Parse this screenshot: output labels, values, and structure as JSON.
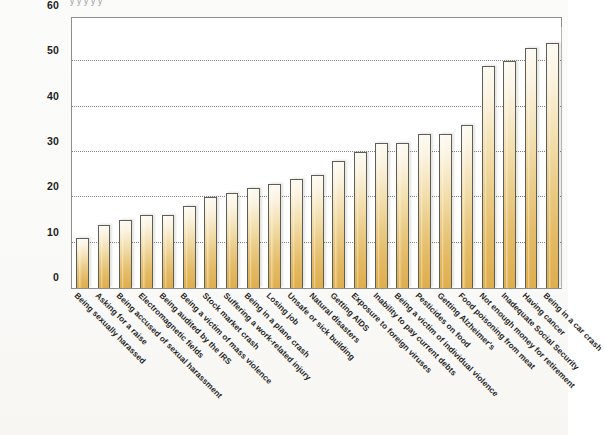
{
  "figure": {
    "title_strip": "y y y                     y                 y",
    "background_color": "#fafaf8"
  },
  "chart_data": {
    "type": "bar",
    "title": "",
    "xlabel": "",
    "ylabel": "",
    "ylim": [
      0,
      60
    ],
    "yticks": [
      0,
      10,
      20,
      30,
      40,
      50,
      60
    ],
    "ytick_labels": [
      "0",
      "10",
      "20",
      "30",
      "40",
      "50",
      "60"
    ],
    "grid": true,
    "grid_axis": "y",
    "legend": "none",
    "bar_color_top": "#fdfaf2",
    "bar_color_bottom": "#dfae4d",
    "bar_edge_color": "#5d5d59",
    "categories": [
      "Being sexually harassed",
      "Asking for a raise",
      "Being accused of sexual harassment",
      "Electromagnetic fields",
      "Being audited by the IRS",
      "Being a victim of mass violence",
      "Stock market crash",
      "Suffering a work-related injury",
      "Being in a plane crash",
      "Losing job",
      "Unsafe or sick building",
      "Natural disasters",
      "Getting AIDS",
      "Exposure to foreign viruses",
      "Inability to pay current debts",
      "Being a victim of individual violence",
      "Pesticides on food",
      "Getting Alzheimer's",
      "Food poisoning from meat",
      "Not enough money for retirement",
      "Inadequate Social Security",
      "Having cancer",
      "Being in a car crash"
    ],
    "values": [
      11,
      14,
      15,
      16,
      16,
      18,
      20,
      21,
      22,
      23,
      24,
      25,
      28,
      30,
      32,
      32,
      34,
      34,
      36,
      49,
      50,
      53,
      54
    ]
  }
}
